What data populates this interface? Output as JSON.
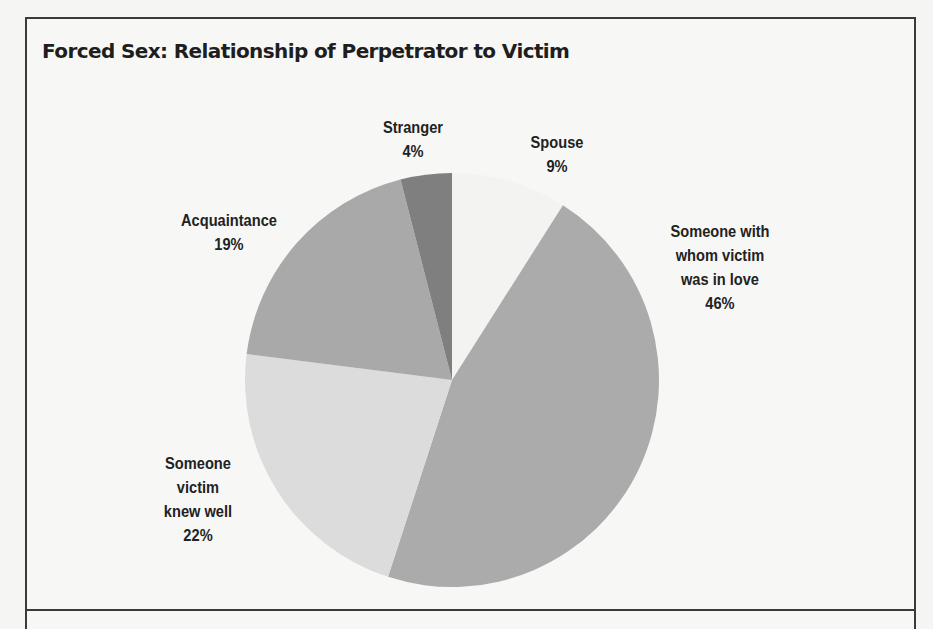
{
  "title": "Forced Sex: Relationship of Perpetrator to Victim",
  "chart_data": {
    "type": "pie",
    "title": "Forced Sex: Relationship of Perpetrator to Victim",
    "start_angle_deg": 0,
    "direction": "clockwise",
    "slices": [
      {
        "label": "Spouse",
        "value": 9,
        "value_label": "9%",
        "color": "#f3f3f2"
      },
      {
        "label": "Someone with whom victim was in love",
        "value": 46,
        "value_label": "46%",
        "color": "#ababab"
      },
      {
        "label": "Someone victim knew well",
        "value": 22,
        "value_label": "22%",
        "color": "#dcdcdc"
      },
      {
        "label": "Acquaintance",
        "value": 19,
        "value_label": "19%",
        "color": "#a9a9a9"
      },
      {
        "label": "Stranger",
        "value": 4,
        "value_label": "4%",
        "color": "#7f7f7f"
      }
    ],
    "categories": [
      "Spouse",
      "Someone with whom victim was in love",
      "Someone victim knew well",
      "Acquaintance",
      "Stranger"
    ],
    "values": [
      9,
      46,
      22,
      19,
      4
    ],
    "unit": "%",
    "legend": "none (direct labels)"
  },
  "labels": {
    "stranger": {
      "lines": [
        "Stranger"
      ],
      "pct": "4%"
    },
    "spouse": {
      "lines": [
        "Spouse"
      ],
      "pct": "9%"
    },
    "love": {
      "lines": [
        "Someone with",
        "whom victim",
        "was in love"
      ],
      "pct": "46%"
    },
    "knew_well": {
      "lines": [
        "Someone",
        "victim",
        "knew well"
      ],
      "pct": "22%"
    },
    "acquaintance": {
      "lines": [
        "Acquaintance"
      ],
      "pct": "19%"
    }
  }
}
